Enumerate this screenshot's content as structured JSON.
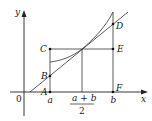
{
  "diagram": {
    "axes": {
      "x_label": "x",
      "y_label": "y",
      "origin_label": "0"
    },
    "ticks": {
      "a": "a",
      "midpoint_numerator": "a + b",
      "midpoint_denominator": "2",
      "b": "b"
    },
    "points": {
      "A": "A",
      "B": "B",
      "C": "C",
      "D": "D",
      "E": "E",
      "F": "F"
    },
    "colors": {
      "ink": "#222222",
      "background": "#ffffff"
    }
  }
}
